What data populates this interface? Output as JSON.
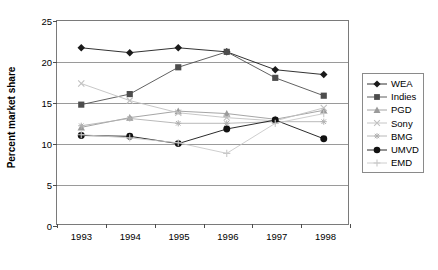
{
  "chart_data": {
    "type": "line",
    "title": "",
    "xlabel": "",
    "ylabel": "Percent market share",
    "categories": [
      "1993",
      "1994",
      "1995",
      "1996",
      "1997",
      "1998"
    ],
    "x": [
      1993,
      1994,
      1995,
      1996,
      1997,
      1998
    ],
    "ylim": [
      0,
      25
    ],
    "yticks": [
      0,
      5,
      10,
      15,
      20,
      25
    ],
    "grid": true,
    "legend_position": "right",
    "series": [
      {
        "name": "WEA",
        "values": [
          21.7,
          21.1,
          21.7,
          21.2,
          19.0,
          18.4
        ],
        "marker": "diamond",
        "color": "#1a1a1a"
      },
      {
        "name": "Indies",
        "values": [
          14.7,
          16.0,
          19.3,
          21.2,
          18.0,
          15.8
        ],
        "marker": "square",
        "color": "#4d4d4d"
      },
      {
        "name": "PGD",
        "values": [
          11.9,
          13.1,
          13.9,
          13.6,
          12.9,
          14.0
        ],
        "marker": "triangle",
        "color": "#9a9a9a"
      },
      {
        "name": "Sony",
        "values": [
          17.3,
          15.2,
          13.7,
          13.1,
          12.7,
          14.3
        ],
        "marker": "cross",
        "color": "#c0c0c0"
      },
      {
        "name": "BMG",
        "values": [
          12.1,
          13.0,
          12.4,
          12.4,
          12.6,
          12.6
        ],
        "marker": "star",
        "color": "#b0b0b0"
      },
      {
        "name": "UMVD",
        "values": [
          10.9,
          10.8,
          9.9,
          11.7,
          12.8,
          10.5
        ],
        "marker": "circle",
        "color": "#111111"
      },
      {
        "name": "EMD",
        "values": [
          11.0,
          10.6,
          10.0,
          8.7,
          12.4,
          13.6
        ],
        "marker": "plus",
        "color": "#c8c8c8"
      }
    ],
    "ytick_labels": [
      "0",
      "5",
      "10",
      "15",
      "20",
      "25"
    ],
    "xtick_labels": [
      "1993",
      "1994",
      "1995",
      "1996",
      "1997",
      "1998"
    ]
  },
  "legend": {
    "items": [
      "WEA",
      "Indies",
      "PGD",
      "Sony",
      "BMG",
      "UMVD",
      "EMD"
    ]
  },
  "axes": {
    "y_title": "Percent market share"
  },
  "colors": {
    "frame": "#7a7a7a",
    "gridline": "#9a9a9a",
    "background": "#ffffff",
    "text": "#000000"
  }
}
